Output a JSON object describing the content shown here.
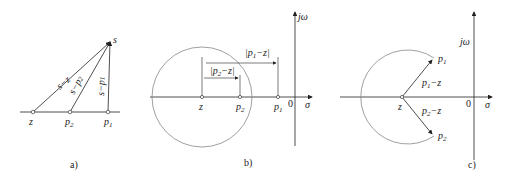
{
  "colors": {
    "ink": "#222222",
    "circle": "#888888",
    "background": "#ffffff"
  },
  "panels": [
    {
      "id": "a",
      "caption": "a)",
      "points": {
        "s": "s",
        "z": "z",
        "p2": "p",
        "p2_sub": "2",
        "p1": "p",
        "p1_sub": "1"
      },
      "vectors": {
        "sz": "s−z",
        "sp2": "s−p",
        "sp2_sub": "2",
        "sp1": "s−p",
        "sp1_sub": "1"
      }
    },
    {
      "id": "b",
      "caption": "b)",
      "axis": {
        "imag": "jω",
        "real": "σ",
        "origin": "0"
      },
      "points": {
        "z": "z",
        "p2": "p",
        "p2_sub": "2",
        "p1": "p",
        "p1_sub": "1"
      },
      "dims": {
        "p1z": "|p",
        "p1z_sub": "1",
        "p1z_rest": "−z|",
        "p2z": "|p",
        "p2z_sub": "2",
        "p2z_rest": "−z|"
      }
    },
    {
      "id": "c",
      "caption": "c)",
      "axis": {
        "imag": "jω",
        "real": "σ",
        "origin": "0"
      },
      "points": {
        "z": "z",
        "p1": "p",
        "p1_sub": "1",
        "p2": "p",
        "p2_sub": "2"
      },
      "vectors": {
        "p1z": "p",
        "p1z_sub": "1",
        "p1z_rest": "−z",
        "p2z": "p",
        "p2z_sub": "2",
        "p2z_rest": "−z"
      }
    }
  ]
}
